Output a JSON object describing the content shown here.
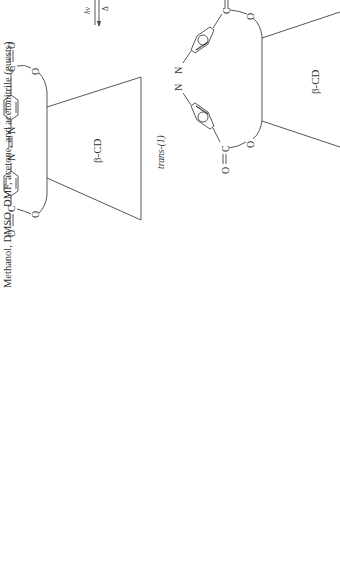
{
  "caption": "Methanol, DMSO, DMF, acetone, and acetonitrile (guests)",
  "left_structure": {
    "host_label": "β-CD",
    "compound_label": "trans-(1)",
    "atoms": {
      "o_carbonyl_bottom": "O",
      "c_bottom": "C",
      "n1": "N",
      "n2": "N",
      "c_top": "C",
      "o_carbonyl_top": "O",
      "o_link_top": "O",
      "o_link_bottom": "O"
    }
  },
  "arrow": {
    "forward_label": "hν",
    "reverse_label": "Δ"
  },
  "right_structure": {
    "host_label": "β-CD",
    "atoms": {
      "n1": "N",
      "n2": "N",
      "c_top": "C",
      "o_carbonyl_top": "O",
      "c_bottom": "C",
      "o_carbonyl_bottom": "O",
      "o_link_top": "O",
      "o_link_bottom": "O"
    }
  },
  "colors": {
    "line": "#444444",
    "text": "#333333",
    "background": "#ffffff"
  }
}
